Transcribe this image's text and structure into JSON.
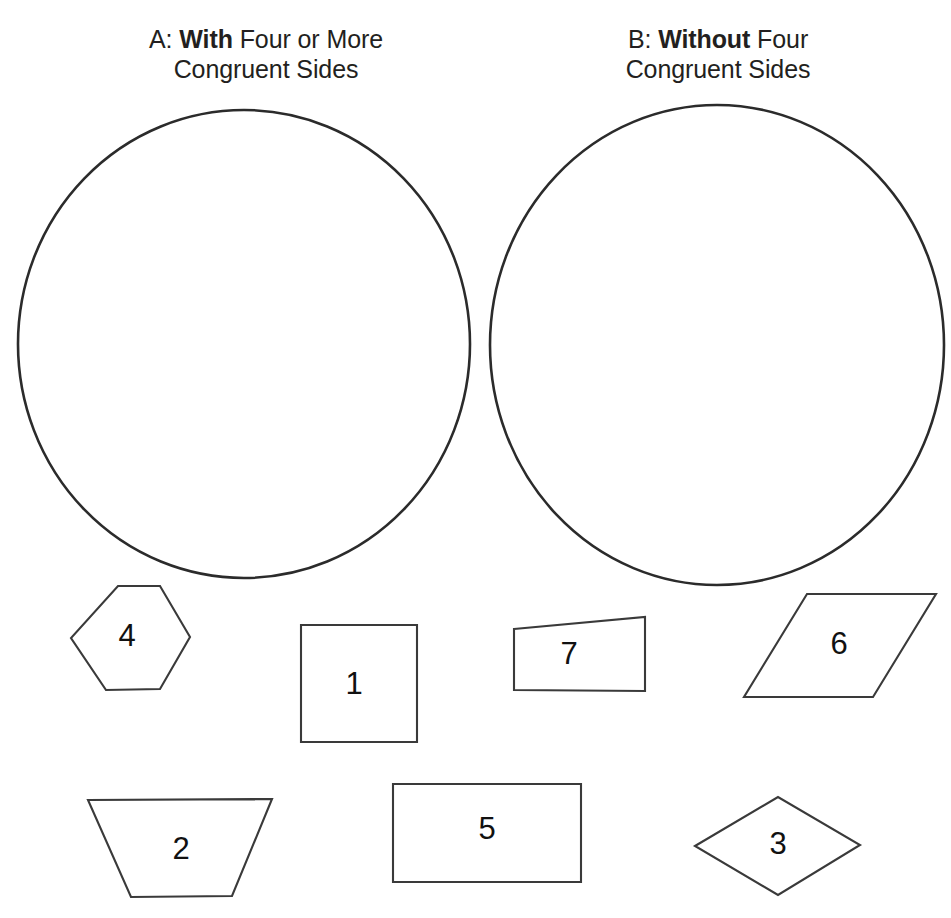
{
  "page": {
    "width": 951,
    "height": 918,
    "background_color": "#ffffff",
    "ink_color": "#231f20",
    "shape_stroke_color": "#3a3a3a",
    "circle_stroke_color": "#2b2b2b"
  },
  "headings": {
    "a": {
      "prefix": "A:",
      "emphasis": "With",
      "line1_rest": "Four or More",
      "line2": "Congruent Sides",
      "line1_full": "A: With Four or More",
      "full": "A: With Four or More Congruent Sides"
    },
    "b": {
      "prefix": "B:",
      "emphasis": "Without",
      "line1_rest": "Four",
      "line2": "Congruent Sides",
      "line1_full": "B: Without Four",
      "full": "B: Without Four Congruent Sides"
    }
  },
  "venn": {
    "circles": [
      {
        "id": "circle-a",
        "label": "A",
        "cx": 244,
        "cy": 344,
        "rx": 226,
        "ry": 234,
        "contents": []
      },
      {
        "id": "circle-b",
        "label": "B",
        "cx": 717,
        "cy": 345,
        "rx": 227,
        "ry": 240,
        "contents": []
      }
    ]
  },
  "shapes": [
    {
      "id": "shape-4",
      "label": "4",
      "kind": "hexagon",
      "points": "118,586 160,586 190,637 160,689 106,690 71,638",
      "label_x": 127,
      "label_y": 638
    },
    {
      "id": "shape-1",
      "label": "1",
      "kind": "square",
      "points": "301,625 417,625 417,742 301,742",
      "label_x": 354,
      "label_y": 686
    },
    {
      "id": "shape-7",
      "label": "7",
      "kind": "irregular-quadrilateral",
      "points": "514,629 645,617 645,691 514,690",
      "label_x": 569,
      "label_y": 656
    },
    {
      "id": "shape-6",
      "label": "6",
      "kind": "parallelogram",
      "points": "807,594 936,594 873,697 744,697",
      "label_x": 839,
      "label_y": 646
    },
    {
      "id": "shape-2",
      "label": "2",
      "kind": "trapezoid",
      "points": "88,800 272,799 232,896 131,897",
      "label_x": 181,
      "label_y": 851
    },
    {
      "id": "shape-5",
      "label": "5",
      "kind": "rectangle",
      "points": "393,784 581,784 581,882 393,882",
      "label_x": 487,
      "label_y": 831
    },
    {
      "id": "shape-3",
      "label": "3",
      "kind": "rhombus",
      "points": "695,846 778,797 860,845 778,895",
      "label_x": 778,
      "label_y": 846
    }
  ]
}
